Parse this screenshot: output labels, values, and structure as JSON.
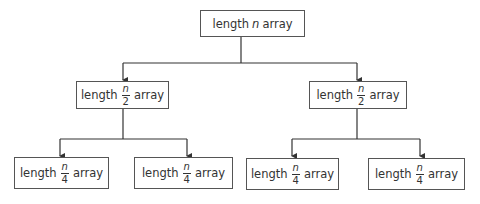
{
  "diagram": {
    "type": "tree",
    "title": "",
    "colors": {
      "box_border": "#555555",
      "line": "#333333",
      "text": "#333333",
      "background": "#ffffff"
    },
    "root": {
      "prefix": "length",
      "variable": "n",
      "suffix": "array"
    },
    "level1": [
      {
        "prefix": "length",
        "numerator": "n",
        "denominator": "2",
        "suffix": "array"
      },
      {
        "prefix": "length",
        "numerator": "n",
        "denominator": "2",
        "suffix": "array"
      }
    ],
    "level2": [
      {
        "prefix": "length",
        "numerator": "n",
        "denominator": "4",
        "suffix": "array"
      },
      {
        "prefix": "length",
        "numerator": "n",
        "denominator": "4",
        "suffix": "array"
      },
      {
        "prefix": "length",
        "numerator": "n",
        "denominator": "4",
        "suffix": "array"
      },
      {
        "prefix": "length",
        "numerator": "n",
        "denominator": "4",
        "suffix": "array"
      }
    ]
  }
}
